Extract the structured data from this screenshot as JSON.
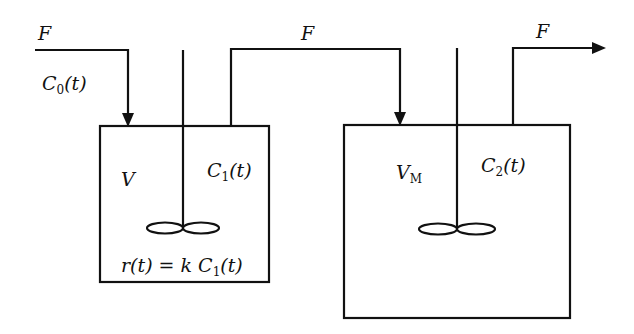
{
  "diagram": {
    "type": "two-tank reactor cascade",
    "stroke_color": "#111111",
    "labels": {
      "inlet_flow": "F",
      "inlet_concentration": "C0(t)",
      "connector_flow": "F",
      "outlet_flow": "F",
      "tank1_volume": "V",
      "tank1_concentration": "C1(t)",
      "tank1_reaction": "r(t) = k C1(t)",
      "tank2_volume": "VM",
      "tank2_concentration": "C2(t)"
    },
    "labels_parts": {
      "c0_main": "C",
      "c0_sub": "0",
      "c0_tail": "(t)",
      "c1_main": "C",
      "c1_sub": "1",
      "c1_tail": "(t)",
      "r_head": "r(t) = k C",
      "r_sub": "1",
      "r_tail": "(t)",
      "vm_main": "V",
      "vm_sub": "M",
      "c2_main": "C",
      "c2_sub": "2",
      "c2_tail": "(t)"
    },
    "nodes": [
      {
        "id": "tank1",
        "label": "V",
        "concentration": "C1(t)",
        "reaction": "r(t) = k C1(t)",
        "stirred": true
      },
      {
        "id": "tank2",
        "label": "VM",
        "concentration": "C2(t)",
        "stirred": true
      }
    ],
    "edges": [
      {
        "from": "inlet",
        "to": "tank1",
        "label": "F"
      },
      {
        "from": "tank1",
        "to": "tank2",
        "label": "F"
      },
      {
        "from": "tank2",
        "to": "outlet",
        "label": "F"
      }
    ]
  }
}
